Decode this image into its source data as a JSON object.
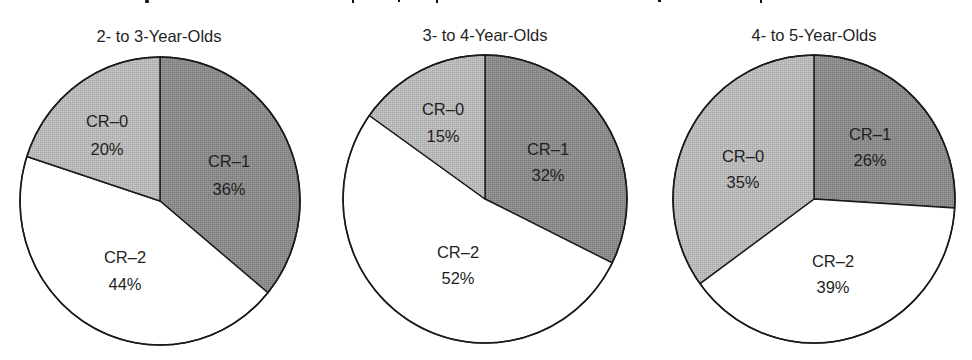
{
  "chart_data": [
    {
      "type": "pie",
      "title": "2- to 3-Year-Olds",
      "categories": [
        "CR–1",
        "CR–2",
        "CR–0"
      ],
      "values": [
        36,
        44,
        20
      ],
      "labels": [
        "CR–1\n36%",
        "CR–2\n44%",
        "CR–0\n20%"
      ],
      "start_angle_deg": 0,
      "direction": "clockwise"
    },
    {
      "type": "pie",
      "title": "3- to 4-Year-Olds",
      "categories": [
        "CR–1",
        "CR–2",
        "CR–0"
      ],
      "values": [
        32,
        52,
        15
      ],
      "labels": [
        "CR–1\n32%",
        "CR–2\n52%",
        "CR–0\n15%"
      ],
      "start_angle_deg": 0,
      "direction": "clockwise"
    },
    {
      "type": "pie",
      "title": "4- to 5-Year-Olds",
      "categories": [
        "CR–1",
        "CR–2",
        "CR–0"
      ],
      "values": [
        26,
        39,
        35
      ],
      "labels": [
        "CR–1\n26%",
        "CR–2\n39%",
        "CR–0\n35%"
      ],
      "start_angle_deg": 0,
      "direction": "clockwise"
    }
  ],
  "colors": {
    "CR–1": "#8c8c8c",
    "CR–2": "#ffffff",
    "CR–0": "#b9b9b9",
    "outline": "#1a1a1a",
    "text": "#1f1f1f"
  },
  "pies": [
    {
      "subtitle": "2- to 3-Year-Olds",
      "slices": [
        {
          "name": "CR–1",
          "value": 36,
          "label": "CR–1",
          "pct": "36%"
        },
        {
          "name": "CR–2",
          "value": 44,
          "label": "CR–2",
          "pct": "44%"
        },
        {
          "name": "CR–0",
          "value": 20,
          "label": "CR–0",
          "pct": "20%"
        }
      ]
    },
    {
      "subtitle": "3- to 4-Year-Olds",
      "slices": [
        {
          "name": "CR–1",
          "value": 32,
          "label": "CR–1",
          "pct": "32%"
        },
        {
          "name": "CR–2",
          "value": 52,
          "label": "CR–2",
          "pct": "52%"
        },
        {
          "name": "CR–0",
          "value": 15,
          "label": "CR–0",
          "pct": "15%"
        }
      ]
    },
    {
      "subtitle": "4- to 5-Year-Olds",
      "slices": [
        {
          "name": "CR–1",
          "value": 26,
          "label": "CR–1",
          "pct": "26%"
        },
        {
          "name": "CR–2",
          "value": 39,
          "label": "CR–2",
          "pct": "39%"
        },
        {
          "name": "CR–0",
          "value": 35,
          "label": "CR–0",
          "pct": "35%"
        }
      ]
    }
  ]
}
